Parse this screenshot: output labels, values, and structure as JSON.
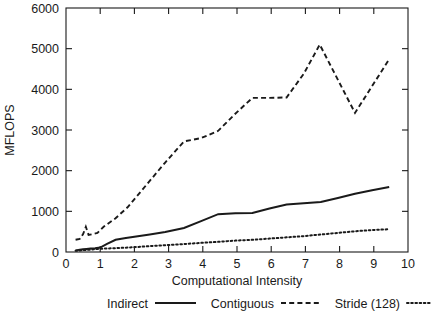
{
  "chart_data": {
    "type": "line",
    "title": "",
    "xlabel": "Computational Intensity",
    "ylabel": "MFLOPS",
    "xlim": [
      0,
      10
    ],
    "ylim": [
      0,
      6000
    ],
    "xticks": [
      0,
      1,
      2,
      3,
      4,
      5,
      6,
      7,
      8,
      9,
      10
    ],
    "yticks": [
      0,
      1000,
      2000,
      3000,
      4000,
      5000,
      6000
    ],
    "xtick_labels": [
      "0",
      "1",
      "2",
      "3",
      "4",
      "5",
      "6",
      "7",
      "8",
      "9",
      "10"
    ],
    "ytick_labels": [
      "0",
      "1000",
      "2000",
      "3000",
      "4000",
      "5000",
      "6000"
    ],
    "grid": false,
    "legend_position": "bottom",
    "frame": "box",
    "series": [
      {
        "name": "Indirect",
        "style": "solid",
        "x": [
          0.28,
          0.4,
          0.5,
          0.6,
          0.72,
          0.85,
          1.0,
          1.2,
          1.45,
          1.75,
          2.1,
          2.45,
          2.9,
          3.45,
          3.95,
          4.45,
          4.95,
          5.45,
          5.95,
          6.45,
          6.95,
          7.45,
          7.95,
          8.45,
          8.95,
          9.45
        ],
        "y": [
          40,
          55,
          65,
          75,
          85,
          95,
          110,
          200,
          300,
          345,
          390,
          430,
          490,
          590,
          760,
          930,
          950,
          960,
          1070,
          1170,
          1200,
          1230,
          1330,
          1430,
          1520,
          1600
        ]
      },
      {
        "name": "Contiguous",
        "style": "dashed",
        "x": [
          0.28,
          0.4,
          0.5,
          0.58,
          0.66,
          0.78,
          0.92,
          1.1,
          1.45,
          1.8,
          2.15,
          2.5,
          2.9,
          3.45,
          3.95,
          4.45,
          4.95,
          5.45,
          5.95,
          6.45,
          6.95,
          7.42,
          8.45,
          9.45
        ],
        "y": [
          300,
          320,
          440,
          620,
          420,
          440,
          470,
          620,
          830,
          1100,
          1450,
          1800,
          2200,
          2720,
          2800,
          2980,
          3400,
          3790,
          3790,
          3800,
          4380,
          5100,
          3420,
          4740
        ]
      },
      {
        "name": "Stride (128)",
        "style": "dotted",
        "x": [
          0.28,
          0.5,
          0.75,
          1.0,
          1.45,
          1.95,
          2.45,
          2.95,
          3.45,
          3.95,
          4.45,
          4.95,
          5.45,
          5.95,
          6.45,
          6.95,
          7.45,
          7.95,
          8.45,
          8.95,
          9.45
        ],
        "y": [
          30,
          45,
          60,
          80,
          95,
          115,
          145,
          170,
          195,
          225,
          250,
          280,
          300,
          330,
          360,
          390,
          430,
          470,
          510,
          540,
          560
        ]
      }
    ]
  },
  "legend": {
    "items": [
      {
        "label": "Indirect",
        "style": "solid"
      },
      {
        "label": "Contiguous",
        "style": "dashed"
      },
      {
        "label": "Stride (128)",
        "style": "dotted"
      }
    ]
  },
  "colors": {
    "foreground": "#1a1a1a",
    "background": "#ffffff"
  }
}
